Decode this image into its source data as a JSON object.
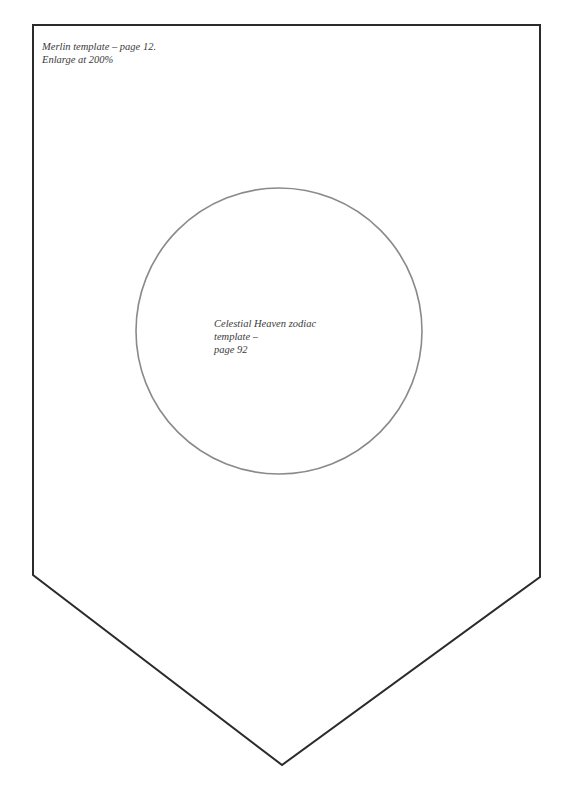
{
  "document": {
    "top_note": {
      "line1": "Merlin template – page 12.",
      "line2": "Enlarge at 200%"
    },
    "circle_note": {
      "line1": "Celestial Heaven zodiac template –",
      "line2": "page 92"
    },
    "colors": {
      "banner_outline": "#2b2b2b",
      "circle_outline": "#8a8a8a",
      "background": "#ffffff",
      "text": "#3a3a3a"
    }
  }
}
